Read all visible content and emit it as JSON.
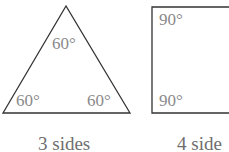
{
  "figure": {
    "triangle": {
      "angles": [
        "60°",
        "60°",
        "60°"
      ],
      "caption": "3 sides"
    },
    "square": {
      "angles": [
        "90°",
        "90°"
      ],
      "caption": "4 side"
    },
    "colors": {
      "stroke": "#333333",
      "angle_label": "#8a8a8a",
      "caption": "#6e6e6e"
    }
  }
}
